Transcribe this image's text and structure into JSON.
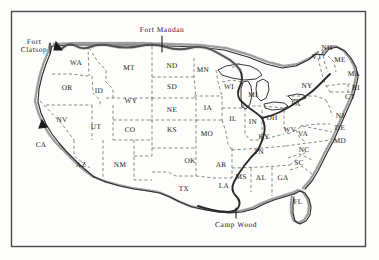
{
  "figure": {
    "type": "map",
    "width": 379,
    "height": 260,
    "frame": {
      "x": 11,
      "y": 11,
      "width": 355,
      "height": 236,
      "stroke": "#3a3a3a"
    },
    "background_color": "#fdfdfb",
    "ink_color": "#1a1a1a",
    "border_color": "#4a4a4a",
    "state_border_style": "dashed",
    "coast_style": "stippled-hatched"
  },
  "places": [
    {
      "name": "Fort Clatsop",
      "lines": [
        "Fort",
        "Clatsop"
      ],
      "x": 34,
      "y": 46,
      "marker_x": 53,
      "marker_y": 47
    },
    {
      "name": "Fort Mandan",
      "lines": [
        "Fort Mandan"
      ],
      "x": 162,
      "y": 30,
      "marker_x": 162,
      "marker_y": 47
    },
    {
      "name": "Camp Wood",
      "lines": [
        "Camp Wood"
      ],
      "x": 236,
      "y": 225,
      "marker_x": 236,
      "marker_y": 212
    }
  ],
  "states": [
    {
      "code": "WA",
      "x": 76,
      "y": 63
    },
    {
      "code": "OR",
      "x": 67,
      "y": 88
    },
    {
      "code": "ID",
      "x": 99,
      "y": 91
    },
    {
      "code": "MT",
      "x": 129,
      "y": 68
    },
    {
      "code": "ND",
      "x": 172,
      "y": 66
    },
    {
      "code": "MN",
      "x": 203,
      "y": 70
    },
    {
      "code": "WI",
      "x": 229,
      "y": 87
    },
    {
      "code": "MI",
      "x": 253,
      "y": 95
    },
    {
      "code": "SD",
      "x": 172,
      "y": 87
    },
    {
      "code": "WY",
      "x": 131,
      "y": 101
    },
    {
      "code": "NV",
      "x": 62,
      "y": 120
    },
    {
      "code": "UT",
      "x": 96,
      "y": 127
    },
    {
      "code": "CO",
      "x": 130,
      "y": 130
    },
    {
      "code": "NE",
      "x": 172,
      "y": 110
    },
    {
      "code": "IA",
      "x": 208,
      "y": 108
    },
    {
      "code": "IL",
      "x": 233,
      "y": 119
    },
    {
      "code": "IN",
      "x": 253,
      "y": 122
    },
    {
      "code": "OH",
      "x": 272,
      "y": 118
    },
    {
      "code": "PA",
      "x": 296,
      "y": 104
    },
    {
      "code": "NY",
      "x": 307,
      "y": 86
    },
    {
      "code": "VT",
      "x": 317,
      "y": 57
    },
    {
      "code": "NH",
      "x": 327,
      "y": 48
    },
    {
      "code": "ME",
      "x": 340,
      "y": 60
    },
    {
      "code": "MA",
      "x": 354,
      "y": 74
    },
    {
      "code": "RI",
      "x": 356,
      "y": 88
    },
    {
      "code": "CT",
      "x": 350,
      "y": 97
    },
    {
      "code": "NJ",
      "x": 340,
      "y": 116
    },
    {
      "code": "DE",
      "x": 340,
      "y": 128
    },
    {
      "code": "MD",
      "x": 340,
      "y": 141
    },
    {
      "code": "WV",
      "x": 290,
      "y": 130
    },
    {
      "code": "VA",
      "x": 303,
      "y": 134
    },
    {
      "code": "KY",
      "x": 264,
      "y": 137
    },
    {
      "code": "NC",
      "x": 304,
      "y": 150
    },
    {
      "code": "SC",
      "x": 299,
      "y": 163
    },
    {
      "code": "KS",
      "x": 172,
      "y": 130
    },
    {
      "code": "MO",
      "x": 207,
      "y": 134
    },
    {
      "code": "CA",
      "x": 41,
      "y": 145
    },
    {
      "code": "AZ",
      "x": 81,
      "y": 165
    },
    {
      "code": "NM",
      "x": 120,
      "y": 165
    },
    {
      "code": "OK",
      "x": 190,
      "y": 161
    },
    {
      "code": "AR",
      "x": 221,
      "y": 165
    },
    {
      "code": "TN",
      "x": 259,
      "y": 152
    },
    {
      "code": "MS",
      "x": 241,
      "y": 177
    },
    {
      "code": "AL",
      "x": 261,
      "y": 178
    },
    {
      "code": "GA",
      "x": 283,
      "y": 178
    },
    {
      "code": "LA",
      "x": 224,
      "y": 186
    },
    {
      "code": "TX",
      "x": 184,
      "y": 189
    },
    {
      "code": "FL",
      "x": 298,
      "y": 202
    }
  ]
}
